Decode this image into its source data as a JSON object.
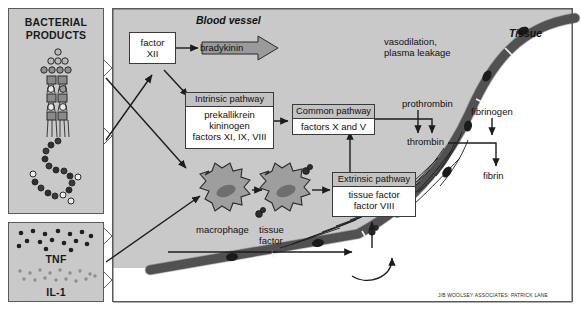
{
  "figure": {
    "left_panels": [
      {
        "name": "bacterial-products",
        "label_lines": [
          "BACTERIAL",
          "PRODUCTS"
        ]
      },
      {
        "name": "cytokines",
        "labels": [
          "TNF",
          "IL-1"
        ]
      }
    ],
    "regions": [
      {
        "name": "blood-vessel",
        "title": "Blood vessel"
      },
      {
        "name": "tissue",
        "title": "Tissue"
      }
    ],
    "boxes": [
      {
        "name": "factor-xii",
        "header": "",
        "body": [
          "factor",
          "XII"
        ]
      },
      {
        "name": "intrinsic-pathway",
        "header": "Intrinsic pathway",
        "body": [
          "prekallikrein",
          "kininogen",
          "factors XI, IX, VIII"
        ]
      },
      {
        "name": "common-pathway",
        "header": "Common pathway",
        "body": [
          "factors X and V"
        ]
      },
      {
        "name": "extrinsic-pathway",
        "header": "Extrinsic pathway",
        "body": [
          "tissue factor",
          "factor VIII"
        ]
      }
    ],
    "labels": [
      {
        "name": "bradykinin",
        "text": "bradykinin"
      },
      {
        "name": "vasodilation",
        "lines": [
          "vasodilation,",
          "plasma leakage"
        ]
      },
      {
        "name": "prothrombin",
        "text": "prothrombin"
      },
      {
        "name": "thrombin",
        "text": "thrombin"
      },
      {
        "name": "fibrinogen",
        "text": "fibrinogen"
      },
      {
        "name": "fibrin",
        "text": "fibrin"
      },
      {
        "name": "macrophage",
        "text": "macrophage"
      },
      {
        "name": "tissue-factor",
        "lines": [
          "tissue",
          "factor"
        ]
      }
    ],
    "credit": "J/B WOOLSEY ASSOCIATES: PATRICK LANE",
    "colors": {
      "panel_fill": "#c9c9c9",
      "panel_stroke": "#5a5a5a",
      "box_fill": "#ffffff",
      "box_header_fill": "#c2c2c2",
      "arrow_stroke": "#1c1c1c",
      "block_arrow_fill": "#9a9a9a",
      "vessel_wall": "#5f5f5f",
      "cell_fill": "#9e9e9e",
      "nucleus_fill": "#6e6e6e",
      "background": "#ffffff"
    }
  }
}
